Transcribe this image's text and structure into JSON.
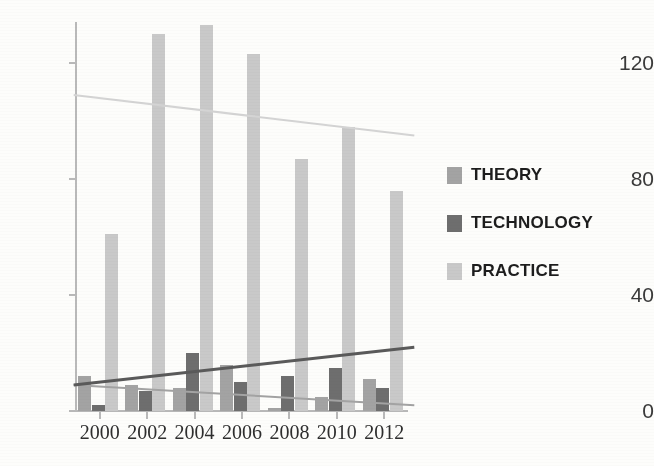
{
  "chart_data": {
    "type": "bar",
    "title": "",
    "subtitle": "",
    "xlabel": "",
    "ylabel": "",
    "categories": [
      "2000",
      "2002",
      "2004",
      "2006",
      "2008",
      "2010",
      "2012"
    ],
    "ylim": [
      0,
      140
    ],
    "y_ticks": [
      0,
      40,
      80,
      120
    ],
    "y_tick_labels": [
      "0",
      "40",
      "80",
      "120"
    ],
    "grid": false,
    "legend_position": "right",
    "series": [
      {
        "name": "THEORY",
        "color": "#a3a3a3",
        "values": [
          12,
          9,
          8,
          16,
          1,
          5,
          11
        ]
      },
      {
        "name": "TECHNOLOGY",
        "color": "#6e6e6e",
        "values": [
          2,
          7,
          20,
          10,
          12,
          15,
          8
        ]
      },
      {
        "name": "PRACTICE",
        "color": "#c9c9c9",
        "values": [
          61,
          130,
          133,
          123,
          87,
          98,
          76
        ]
      }
    ],
    "trendlines": [
      {
        "series": "THEORY",
        "color": "#a3a3a3",
        "start_value": 9,
        "end_value": 2,
        "style": "linear"
      },
      {
        "series": "TECHNOLOGY",
        "color": "#5a5a5a",
        "start_value": 9,
        "end_value": 22,
        "style": "linear"
      },
      {
        "series": "PRACTICE",
        "color": "#d4d4d4",
        "start_value": 109,
        "end_value": 95,
        "style": "linear"
      }
    ]
  },
  "axes": {
    "y_axis_color": "#b9b9b9",
    "x_axis_color": "#b9b9b9"
  },
  "legend": {
    "items": [
      {
        "label": "THEORY",
        "color": "#a3a3a3"
      },
      {
        "label": "TECHNOLOGY",
        "color": "#6e6e6e"
      },
      {
        "label": "PRACTICE",
        "color": "#c9c9c9"
      }
    ]
  },
  "background": "#fdfdfb"
}
